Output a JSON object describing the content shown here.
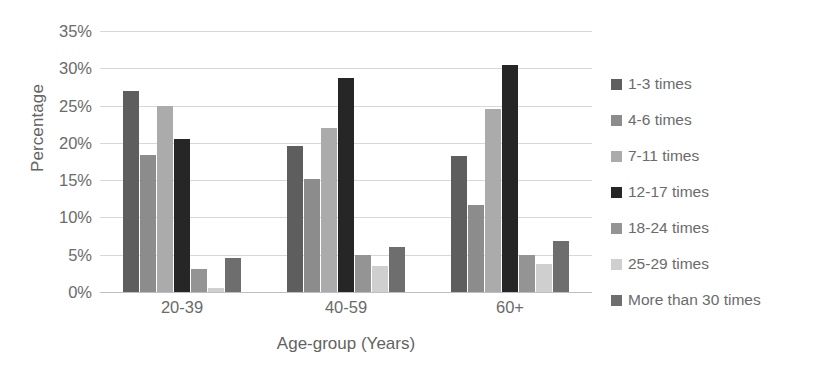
{
  "chart_data": {
    "type": "bar",
    "title": "",
    "xlabel": "Age-group (Years)",
    "ylabel": "Percentage",
    "categories": [
      "20-39",
      "40-59",
      "60+"
    ],
    "ylim": [
      0,
      35
    ],
    "ytick_step": 5,
    "ytick_labels": [
      "35%",
      "30%",
      "25%",
      "20%",
      "15%",
      "10%",
      "5%",
      "0%"
    ],
    "ytick_values": [
      35,
      30,
      25,
      20,
      15,
      10,
      5,
      0
    ],
    "grid": true,
    "legend_position": "right",
    "value_suffix": "%",
    "series": [
      {
        "name": "1-3 times",
        "color": "#5e5e5e",
        "values": [
          27.0,
          19.6,
          18.3
        ]
      },
      {
        "name": "4-6 times",
        "color": "#8c8c8c",
        "values": [
          18.4,
          15.2,
          11.7
        ]
      },
      {
        "name": "7-11 times",
        "color": "#ababab",
        "values": [
          25.0,
          22.0,
          24.6
        ]
      },
      {
        "name": "12-17 times",
        "color": "#262626",
        "values": [
          20.5,
          28.7,
          30.5
        ]
      },
      {
        "name": "18-24 times",
        "color": "#949494",
        "values": [
          3.1,
          5.0,
          5.0
        ]
      },
      {
        "name": "25-29 times",
        "color": "#cfcfcf",
        "values": [
          0.5,
          3.5,
          3.8
        ]
      },
      {
        "name": "More than 30 times",
        "color": "#6e6e6e",
        "values": [
          4.5,
          6.0,
          6.8
        ]
      }
    ]
  }
}
